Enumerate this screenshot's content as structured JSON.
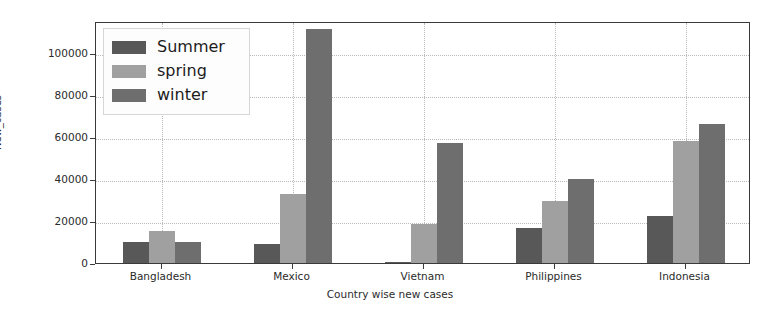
{
  "chart_data": {
    "type": "bar",
    "title": "",
    "xlabel": "Country wise new cases",
    "ylabel": "New_cases",
    "categories": [
      "Bangladesh",
      "Mexico",
      "Vietnam",
      "Philippines",
      "Indonesia"
    ],
    "series": [
      {
        "name": "Summer",
        "color": "#585858",
        "values": [
          9800,
          9000,
          700,
          16500,
          22500
        ]
      },
      {
        "name": "spring",
        "color": "#a0a0a0",
        "values": [
          15300,
          33000,
          18500,
          29500,
          58000
        ]
      },
      {
        "name": "winter",
        "color": "#6e6e6e",
        "values": [
          9800,
          111000,
          57000,
          40000,
          66000
        ]
      }
    ],
    "ylim": [
      0,
      115000
    ],
    "yticks": [
      0,
      20000,
      40000,
      60000,
      80000,
      100000
    ],
    "ytick_labels": [
      "0",
      "20000",
      "40000",
      "60000",
      "80000",
      "100000"
    ],
    "grid": true,
    "legend_position": "upper left"
  },
  "legend": {
    "entries": [
      {
        "label": "Summer"
      },
      {
        "label": "spring"
      },
      {
        "label": "winter"
      }
    ]
  }
}
